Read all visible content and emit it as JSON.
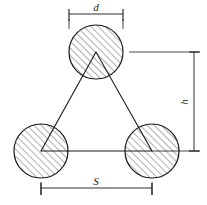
{
  "figure": {
    "background_color": "#ffffff",
    "line_color": "#1a1a1a",
    "hatch_color": "#555555",
    "line_width": 1
  },
  "labels": {
    "diameter": "d",
    "height": "h",
    "spacing": "S"
  },
  "dimensions": {
    "diameter_label": "d",
    "height_label": "h",
    "spacing_label": "S"
  },
  "geometry": {
    "circle_radius": 27,
    "circles": [
      {
        "name": "top-circle",
        "cx": 96,
        "cy": 52
      },
      {
        "name": "bottom-left-circle",
        "cx": 41,
        "cy": 151
      },
      {
        "name": "bottom-right-circle",
        "cx": 152,
        "cy": 151
      }
    ],
    "triangle_points": "96,52 41,151 152,151",
    "hatch_angle_deg": 45,
    "hatch_spacing": 5
  },
  "dimension_lines": {
    "diameter": {
      "name": "d",
      "orientation": "horizontal",
      "x1": 69,
      "x2": 123,
      "y": 14,
      "label_x": 96,
      "label_y": 11
    },
    "height": {
      "name": "h",
      "orientation": "vertical",
      "x": 194,
      "y1": 52,
      "y2": 151,
      "label_x": 189,
      "label_y": 101
    },
    "spacing": {
      "name": "S",
      "orientation": "horizontal",
      "x1": 41,
      "x2": 152,
      "y": 188,
      "label_x": 96,
      "label_y": 185
    }
  },
  "extension_lines": [
    {
      "name": "ext-top-left",
      "x1": 69,
      "y1": 20,
      "x2": 69,
      "y2": 30
    },
    {
      "name": "ext-top-right",
      "x1": 123,
      "y1": 20,
      "x2": 123,
      "y2": 30
    },
    {
      "name": "ext-height-top",
      "x1": 129,
      "y1": 52,
      "x2": 200,
      "y2": 52
    },
    {
      "name": "ext-height-bottom",
      "x1": 152,
      "y1": 151,
      "x2": 200,
      "y2": 151
    },
    {
      "name": "ext-spacing-left",
      "x1": 41,
      "y1": 178,
      "x2": 41,
      "y2": 196
    },
    {
      "name": "ext-spacing-right",
      "x1": 152,
      "y1": 178,
      "x2": 152,
      "y2": 196
    }
  ]
}
